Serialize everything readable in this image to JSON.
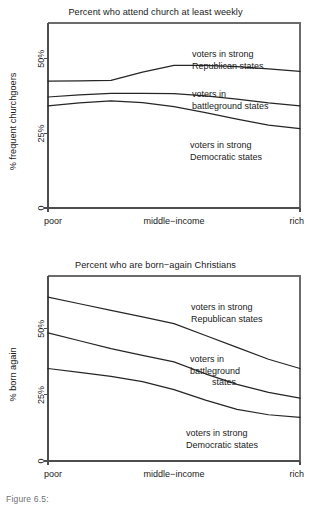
{
  "figure": {
    "caption_fragment": "Figure 6.5:"
  },
  "chart_data": [
    {
      "id": "church-attendance",
      "type": "line",
      "title": "Percent who attend church at least weekly",
      "xlabel": "",
      "ylabel": "% frequent churchgoers",
      "x_tick_labels": [
        "poor",
        "middle−income",
        "rich"
      ],
      "x_tick_positions": [
        0,
        0.5,
        1
      ],
      "y_tick_labels": [
        "0",
        "25%",
        "50%"
      ],
      "y_ticks": [
        0,
        25,
        50
      ],
      "ylim": [
        0,
        62
      ],
      "xlim": [
        0,
        1
      ],
      "grid": false,
      "legend": "inline-annotations",
      "x": [
        0,
        0.125,
        0.25,
        0.375,
        0.5,
        0.625,
        0.75,
        0.875,
        1
      ],
      "series": [
        {
          "name": "voters in strong Republican states",
          "values": [
            42.5,
            42.6,
            42.8,
            45.5,
            47.8,
            47.8,
            47.4,
            46.6,
            45.8
          ]
        },
        {
          "name": "voters in battleground states",
          "values": [
            37.2,
            37.9,
            38.4,
            38.4,
            38.3,
            37.6,
            36.5,
            35.2,
            34.2
          ]
        },
        {
          "name": "voters in strong Democratic states",
          "values": [
            34.2,
            35.2,
            35.9,
            35.3,
            34.0,
            32.0,
            29.8,
            27.8,
            26.6
          ]
        }
      ],
      "annotations": [
        {
          "series": "voters in strong Republican states",
          "lines": [
            "voters in strong",
            "Republican states"
          ]
        },
        {
          "series": "voters in battleground states",
          "lines": [
            "voters in",
            "battleground states"
          ]
        },
        {
          "series": "voters in strong Democratic states",
          "lines": [
            "voters in strong",
            "Democratic states"
          ]
        }
      ]
    },
    {
      "id": "born-again",
      "type": "line",
      "title": "Percent who are born−again Christians",
      "xlabel": "",
      "ylabel": "% born again",
      "x_tick_labels": [
        "poor",
        "middle−income",
        "rich"
      ],
      "x_tick_positions": [
        0,
        0.5,
        1
      ],
      "y_tick_labels": [
        "0",
        "25%",
        "50%"
      ],
      "y_ticks": [
        0,
        25,
        50
      ],
      "ylim": [
        0,
        70
      ],
      "xlim": [
        0,
        1
      ],
      "grid": false,
      "legend": "inline-annotations",
      "x": [
        0,
        0.125,
        0.25,
        0.375,
        0.5,
        0.625,
        0.75,
        0.875,
        1
      ],
      "series": [
        {
          "name": "voters in strong Republican states",
          "values": [
            62.0,
            59.5,
            57.0,
            54.5,
            52.0,
            47.5,
            43.0,
            38.5,
            35.0
          ]
        },
        {
          "name": "voters in battleground states",
          "values": [
            48.5,
            45.5,
            42.5,
            40.0,
            37.5,
            33.0,
            29.0,
            26.0,
            23.8
          ]
        },
        {
          "name": "voters in strong Democratic states",
          "values": [
            35.0,
            33.5,
            32.0,
            30.0,
            27.0,
            23.0,
            19.5,
            17.5,
            16.5
          ]
        }
      ],
      "annotations": [
        {
          "series": "voters in strong Republican states",
          "lines": [
            "voters in strong",
            "Republican states"
          ]
        },
        {
          "series": "voters in battleground states",
          "lines": [
            "voters in",
            "battleground",
            "states"
          ]
        },
        {
          "series": "voters in strong Democratic states",
          "lines": [
            "voters in strong",
            "Democratic states"
          ]
        }
      ]
    }
  ]
}
